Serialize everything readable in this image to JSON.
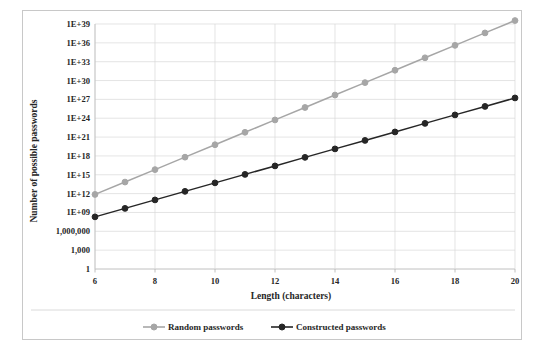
{
  "chart_data": {
    "type": "line",
    "title": "",
    "xlabel": "Length (characters)",
    "ylabel": "Number of possible passwords",
    "yscale": "log",
    "xlim": [
      6,
      20
    ],
    "ylim": [
      1,
      1e+39
    ],
    "grid": true,
    "legend_position": "bottom",
    "x": [
      6,
      7,
      8,
      9,
      10,
      11,
      12,
      13,
      14,
      15,
      16,
      17,
      18,
      19,
      20
    ],
    "xticks": [
      6,
      8,
      10,
      12,
      14,
      16,
      18,
      20
    ],
    "xtick_labels": [
      "6",
      "8",
      "10",
      "12",
      "14",
      "16",
      "18",
      "20"
    ],
    "yticks": [
      1,
      1000,
      1000000,
      1000000000.0,
      1000000000000.0,
      1000000000000000.0,
      1e+18,
      1e+21,
      1e+24,
      1e+27,
      1e+30,
      1e+33,
      1e+36,
      1e+39
    ],
    "ytick_labels": [
      "1",
      "1,000",
      "1,000,000",
      "1E+09",
      "1E+12",
      "1E+15",
      "1E+18",
      "1E+21",
      "1E+24",
      "1E+27",
      "1E+30",
      "1E+33",
      "1E+36",
      "1E+39"
    ],
    "series": [
      {
        "name": "Random passwords",
        "color": "#a6a6a6",
        "marker": "circle",
        "values": [
          735000000000.0,
          69800000000000.0,
          6630000000000000.0,
          6.3e+17,
          5.99e+19,
          5.69e+21,
          5.4e+23,
          5.13e+25,
          4.88e+27,
          4.63e+29,
          4.4e+31,
          4.18e+33,
          3.97e+35,
          3.77e+37,
          3.58e+39
        ],
        "log_values": [
          11.87,
          13.84,
          15.82,
          17.8,
          19.78,
          21.76,
          23.73,
          25.71,
          27.69,
          29.67,
          31.64,
          33.62,
          35.6,
          37.58,
          39.55
        ]
      },
      {
        "name": "Constructed passwords",
        "color": "#262626",
        "marker": "circle",
        "values": [
          200000000.0,
          4500000000.0,
          101000000000.0,
          2280000000000.0,
          51300000000000.0,
          1150000000000000.0,
          2.6e+16,
          5.85e+17,
          1.32e+19,
          2.96e+20,
          6.66e+21,
          1.5e+23,
          3.37e+24,
          7.59e+25,
          1.71e+27
        ],
        "log_values": [
          8.3,
          9.65,
          11.0,
          12.36,
          13.71,
          15.06,
          16.41,
          17.77,
          19.12,
          20.47,
          21.82,
          23.18,
          24.53,
          25.88,
          27.23
        ]
      }
    ]
  },
  "legend": [
    {
      "label": "Random passwords",
      "color": "#a6a6a6"
    },
    {
      "label": "Constructed passwords",
      "color": "#262626"
    }
  ],
  "colors": {
    "random": "#a6a6a6",
    "constructed": "#262626",
    "grid": "#d9d9d9",
    "axis": "#b0b0b0",
    "border": "#c8c8c8",
    "text": "#262626"
  }
}
